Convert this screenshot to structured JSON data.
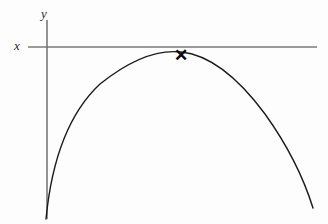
{
  "figure": {
    "background_color": "#fdfdfd",
    "width": 328,
    "height": 224
  },
  "axes": {
    "x_axis": {
      "label": "x",
      "label_x": 17,
      "label_y": 50,
      "color": "#7a7a7a",
      "stroke_width": 1.3,
      "x_start": 28,
      "x_end": 317,
      "y": 47
    },
    "y_axis": {
      "label": "y",
      "label_x": 44,
      "label_y": 18,
      "color": "#6f6f6f",
      "stroke_width": 1.5,
      "x": 47,
      "y_start": 20,
      "y_end": 219
    }
  },
  "curve": {
    "name": "parabola",
    "color": "#1a1a1a",
    "stroke_width": 1.4,
    "vertex_x": 181,
    "vertex_y": 52,
    "left_end_x": 46,
    "left_end_y": 219,
    "right_end_x": 313,
    "right_end_y": 208,
    "path": "M 46 219 Q 55 126 100 84 Q 145 48 181 52 Q 222 56 265 114 Q 298 160 313 208"
  },
  "markers": [
    {
      "name": "vertex-cross-marker",
      "glyph": "✕",
      "x": 181,
      "y": 55,
      "color": "#0a0a0a"
    }
  ]
}
